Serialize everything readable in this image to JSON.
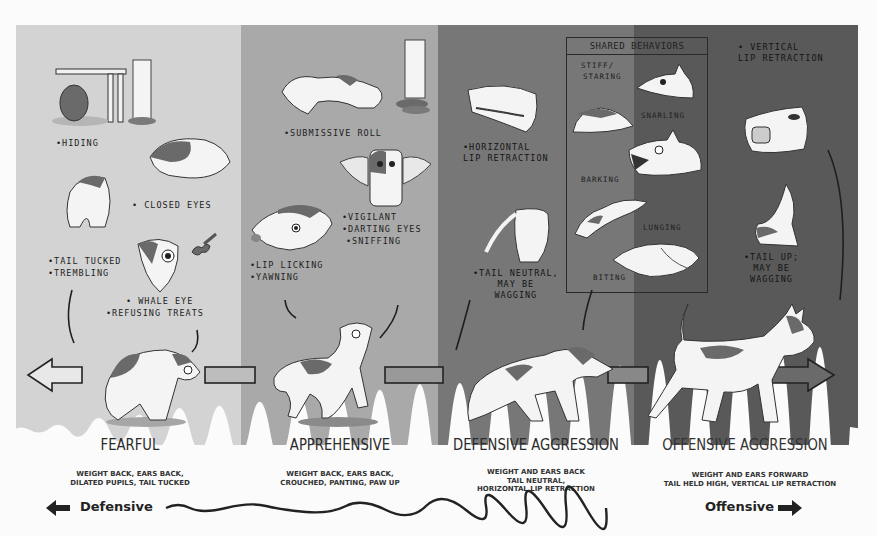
{
  "diagram": {
    "type": "behavior-spectrum",
    "stages": [
      {
        "id": "fearful",
        "title": "FEARFUL",
        "description_lines": [
          "WEIGHT BACK, EARS BACK,",
          "DILATED PUPILS, TAIL TUCKED"
        ],
        "color": "#d3d3d3",
        "behaviors": [
          "•HIDING",
          "• CLOSED EYES",
          "•TAIL TUCKED",
          "•TREMBLING",
          "• WHALE EYE",
          "•REFUSING TREATS"
        ]
      },
      {
        "id": "apprehensive",
        "title": "APPREHENSIVE",
        "description_lines": [
          "WEIGHT BACK, EARS BACK,",
          "CROUCHED, PANTING, PAW UP"
        ],
        "color": "#a9a9a9",
        "behaviors": [
          "•SUBMISSIVE ROLL",
          "•VIGILANT",
          "•DARTING EYES",
          "•SNIFFING",
          "•LIP LICKING",
          "•YAWNING"
        ]
      },
      {
        "id": "defensive-aggression",
        "title": "DEFENSIVE AGGRESSION",
        "description_lines": [
          "WEIGHT AND EARS BACK",
          "TAIL NEUTRAL,",
          "HORIZONTAL LIP RETRACTION"
        ],
        "color": "#777777",
        "behaviors": [
          "•HORIZONTAL",
          "LIP RETRACTION",
          "•TAIL NEUTRAL,",
          "MAY BE",
          "WAGGING"
        ]
      },
      {
        "id": "offensive-aggression",
        "title": "OFFENSIVE AGGRESSION",
        "description_lines": [
          "WEIGHT AND EARS FORWARD",
          "TAIL HELD HIGH, VERTICAL LIP RETRACTION"
        ],
        "color": "#595959",
        "behaviors": [
          "• VERTICAL",
          "LIP RETRACTION",
          "•TAIL UP;",
          "MAY BE",
          "WAGGING"
        ]
      }
    ],
    "shared_behaviors": {
      "title": "SHARED BEHAVIORS",
      "items": [
        "STIFF/",
        "STARING",
        "SNARLING",
        "BARKING",
        "LUNGING",
        "BITING"
      ]
    },
    "axis": {
      "left_label": "Defensive",
      "right_label": "Offensive"
    },
    "colors": {
      "background": "#fbfbfb",
      "ink": "#222222",
      "dog_white": "#f4f4f4",
      "dog_patch": "#6e6e6e"
    }
  }
}
